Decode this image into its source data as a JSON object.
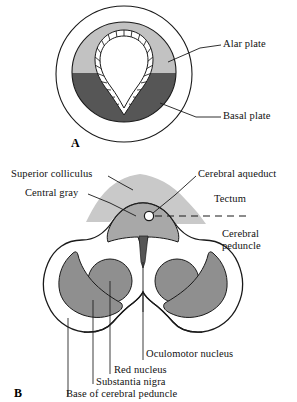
{
  "figure": {
    "panels": [
      {
        "id": "A",
        "letter": "A",
        "caption": "Neural tube cross-section"
      },
      {
        "id": "B",
        "letter": "B",
        "caption": "Midbrain cross-section"
      }
    ]
  },
  "panel_a": {
    "letter": "A",
    "labels": [
      {
        "name": "alar-plate",
        "text": "Alar plate"
      },
      {
        "name": "basal-plate",
        "text": "Basal plate"
      }
    ],
    "regions": [
      {
        "name": "outer-meninges-outline",
        "text": ""
      },
      {
        "name": "alar-plate-region",
        "text": ""
      },
      {
        "name": "basal-plate-region",
        "text": ""
      },
      {
        "name": "ependymal-layer",
        "text": ""
      },
      {
        "name": "neural-canal-lumen",
        "text": ""
      }
    ]
  },
  "panel_b": {
    "letter": "B",
    "labels": [
      {
        "name": "superior-colliculus",
        "text": "Superior colliculus"
      },
      {
        "name": "central-gray",
        "text": "Central gray"
      },
      {
        "name": "cerebral-aqueduct",
        "text": "Cerebral aqueduct"
      },
      {
        "name": "tectum",
        "text": "Tectum"
      },
      {
        "name": "cerebral-peduncle-line1",
        "text": "Cerebral"
      },
      {
        "name": "cerebral-peduncle-line2",
        "text": "peduncle"
      },
      {
        "name": "oculomotor-nucleus",
        "text": "Oculomotor nucleus"
      },
      {
        "name": "red-nucleus",
        "text": "Red nucleus"
      },
      {
        "name": "substantia-nigra",
        "text": "Substantia nigra"
      },
      {
        "name": "base-of-cerebral-peduncle",
        "text": "Base of cerebral peduncle"
      }
    ],
    "regions": [
      {
        "name": "midbrain-outline",
        "text": ""
      },
      {
        "name": "tectum-region",
        "text": ""
      },
      {
        "name": "central-gray-region",
        "text": ""
      },
      {
        "name": "cerebral-aqueduct-lumen",
        "text": ""
      },
      {
        "name": "red-nucleus-left",
        "text": ""
      },
      {
        "name": "red-nucleus-right",
        "text": ""
      },
      {
        "name": "substantia-nigra-left",
        "text": ""
      },
      {
        "name": "substantia-nigra-right",
        "text": ""
      },
      {
        "name": "oculomotor-nucleus-wedge",
        "text": ""
      },
      {
        "name": "tectum-demarcation-dashed-line",
        "text": ""
      }
    ]
  },
  "colors": {
    "outline": "#1a1a1a",
    "alar_plate_gray": "#c2c2c2",
    "basal_plate_gray": "#565656",
    "tectum_gray": "#c9c9c9",
    "central_gray": "#a8a8a8",
    "nucleus_gray": "#8f8f8f",
    "background": "#ffffff",
    "label_text": "#111111"
  }
}
